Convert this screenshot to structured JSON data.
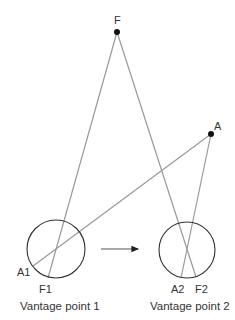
{
  "diagram": {
    "points": {
      "F": {
        "label": "F",
        "x": 117,
        "y": 32
      },
      "A": {
        "label": "A",
        "x": 211,
        "y": 134
      }
    },
    "vantage_points": [
      {
        "caption": "Vantage point 1",
        "circle": {
          "cx": 56,
          "cy": 249,
          "r": 29
        },
        "projections": {
          "A": {
            "label": "A1",
            "x": 33,
            "y": 266
          },
          "F": {
            "label": "F1",
            "x": 48,
            "y": 278
          }
        }
      },
      {
        "caption": "Vantage point 2",
        "circle": {
          "cx": 187,
          "cy": 250,
          "r": 28
        },
        "projections": {
          "A": {
            "label": "A2",
            "x": 181,
            "y": 278
          },
          "F": {
            "label": "F2",
            "x": 196,
            "y": 277
          }
        }
      }
    ],
    "arrow": {
      "x1": 101,
      "y1": 249,
      "x2": 143,
      "y2": 249,
      "meaning": "movement from vantage point 1 to vantage point 2"
    },
    "colors": {
      "ray": "#999999",
      "circle": "#333333",
      "dot": "#111111",
      "text": "#333333",
      "background": "#ffffff"
    }
  }
}
